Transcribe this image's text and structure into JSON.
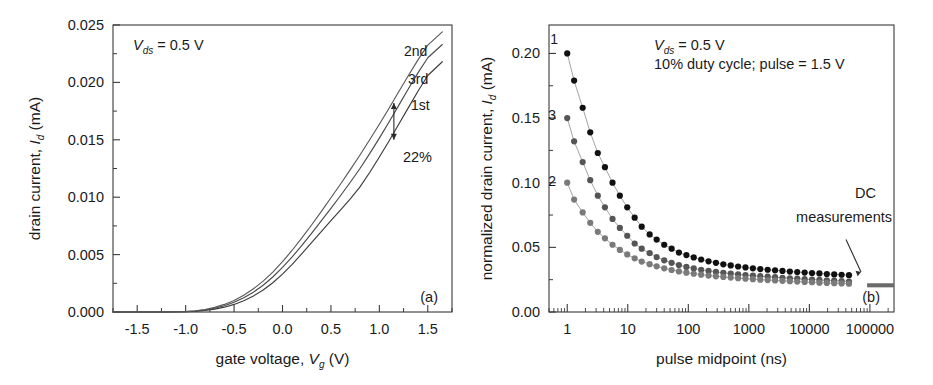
{
  "figure": {
    "background": "#ffffff",
    "panels": [
      "a",
      "b"
    ]
  },
  "panel_a": {
    "tag": "(a)",
    "annotation_vds": "= 0.5 V",
    "annotation_vds_symbol": "V",
    "annotation_vds_sub": "ds",
    "ylabel_prefix": "drain current, ",
    "ylabel_symbol": "I",
    "ylabel_sub": "d",
    "ylabel_suffix": " (mA)",
    "xlabel_prefix": "gate voltage, ",
    "xlabel_symbol": "V",
    "xlabel_sub": "g",
    "xlabel_suffix": " (V)",
    "xticks": [
      "-1.5",
      "-1.0",
      "-0.5",
      "0.0",
      "0.5",
      "1.0",
      "1.5"
    ],
    "yticks": [
      "0.000",
      "0.005",
      "0.010",
      "0.015",
      "0.020",
      "0.025"
    ],
    "curve_labels": [
      "2nd",
      "3rd",
      "1st"
    ],
    "delta_label": "22%"
  },
  "panel_b": {
    "tag": "(b)",
    "annotation_vds_symbol": "V",
    "annotation_vds_sub": "ds",
    "annotation_vds": "= 0.5 V",
    "annotation_duty": "10% duty cycle; pulse = 1.5 V",
    "ylabel_prefix": "normalized drain current, ",
    "ylabel_symbol": "I",
    "ylabel_sub": "d",
    "ylabel_suffix": " (mA)",
    "xlabel": "pulse midpoint (ns)",
    "xticks": [
      "1",
      "10",
      "100",
      "1000",
      "10000",
      "100000"
    ],
    "yticks": [
      "0.00",
      "0.05",
      "0.10",
      "0.15",
      "0.20"
    ],
    "curve_labels": [
      "1",
      "3",
      "2"
    ],
    "dc_label_line1": "DC",
    "dc_label_line2": "measurements"
  },
  "chart_data": [
    {
      "type": "line",
      "panel": "a",
      "title": "",
      "xlabel": "gate voltage, Vg (V)",
      "ylabel": "drain current, Id (mA)",
      "xlim": [
        -1.75,
        1.75
      ],
      "ylim": [
        0.0,
        0.025
      ],
      "xticks": [
        -1.5,
        -1.0,
        -0.5,
        0.0,
        0.5,
        1.0,
        1.5
      ],
      "yticks": [
        0.0,
        0.005,
        0.01,
        0.015,
        0.02,
        0.025
      ],
      "grid": false,
      "legend": "inline-curve-labels",
      "annotations": [
        {
          "text": "Vds = 0.5 V",
          "x": -1.4,
          "y": 0.0235
        },
        {
          "text": "22%",
          "x": 1.15,
          "y": 0.0125
        },
        {
          "text": "(a)",
          "x": 1.5,
          "y": 0.0015
        }
      ],
      "series": [
        {
          "name": "1st",
          "color": "#3c3c3c",
          "x": [
            -1.75,
            -1.5,
            -1.25,
            -1.0,
            -0.9,
            -0.8,
            -0.7,
            -0.6,
            -0.5,
            -0.4,
            -0.3,
            -0.2,
            -0.1,
            0.0,
            0.1,
            0.2,
            0.3,
            0.4,
            0.5,
            0.6,
            0.7,
            0.8,
            0.9,
            1.0,
            1.1,
            1.2,
            1.3,
            1.4,
            1.5,
            1.65
          ],
          "values": [
            0.0,
            0.0,
            0.0,
            2e-05,
            6e-05,
            0.00013,
            0.00025,
            0.00042,
            0.00066,
            0.00098,
            0.0014,
            0.00192,
            0.00255,
            0.0033,
            0.00415,
            0.00508,
            0.00605,
            0.007,
            0.00795,
            0.0089,
            0.00985,
            0.0109,
            0.01215,
            0.0135,
            0.0149,
            0.01635,
            0.0178,
            0.01925,
            0.0206,
            0.0218
          ]
        },
        {
          "name": "3rd",
          "color": "#4a4a4a",
          "x": [
            -1.75,
            -1.5,
            -1.25,
            -1.0,
            -0.9,
            -0.8,
            -0.7,
            -0.6,
            -0.5,
            -0.4,
            -0.3,
            -0.2,
            -0.1,
            0.0,
            0.1,
            0.2,
            0.3,
            0.4,
            0.5,
            0.6,
            0.7,
            0.8,
            0.9,
            1.0,
            1.1,
            1.2,
            1.3,
            1.4,
            1.5,
            1.65
          ],
          "values": [
            0.0,
            0.0,
            0.0,
            3e-05,
            9e-05,
            0.00018,
            0.00033,
            0.00055,
            0.00085,
            0.00124,
            0.00173,
            0.00233,
            0.00305,
            0.00388,
            0.0048,
            0.0058,
            0.00685,
            0.00793,
            0.00903,
            0.01015,
            0.0113,
            0.0125,
            0.0138,
            0.01515,
            0.01655,
            0.018,
            0.01945,
            0.02085,
            0.02215,
            0.0233
          ]
        },
        {
          "name": "2nd",
          "color": "#595959",
          "x": [
            -1.75,
            -1.5,
            -1.25,
            -1.0,
            -0.9,
            -0.8,
            -0.7,
            -0.6,
            -0.5,
            -0.4,
            -0.3,
            -0.2,
            -0.1,
            0.0,
            0.1,
            0.2,
            0.3,
            0.4,
            0.5,
            0.6,
            0.7,
            0.8,
            0.9,
            1.0,
            1.1,
            1.2,
            1.3,
            1.4,
            1.5,
            1.65
          ],
          "values": [
            0.0,
            0.0,
            0.0,
            4e-05,
            0.00011,
            0.00022,
            0.0004,
            0.00066,
            0.00101,
            0.00146,
            0.00202,
            0.00269,
            0.00348,
            0.00438,
            0.00538,
            0.00645,
            0.00758,
            0.00875,
            0.00995,
            0.01115,
            0.0124,
            0.01368,
            0.015,
            0.01635,
            0.01775,
            0.01918,
            0.0206,
            0.02198,
            0.02325,
            0.0244
          ]
        }
      ],
      "delta_marker": {
        "label": "22%",
        "x": 1.15,
        "y_low": 0.015,
        "y_high": 0.0182
      }
    },
    {
      "type": "scatter",
      "panel": "b",
      "title": "",
      "xlabel": "pulse midpoint (ns)",
      "ylabel": "normalized drain current, Id (mA)",
      "xscale": "log",
      "xlim": [
        0.5,
        250000
      ],
      "ylim": [
        0.0,
        0.222
      ],
      "xticks": [
        1,
        10,
        100,
        1000,
        10000,
        100000
      ],
      "yticks": [
        0.0,
        0.05,
        0.1,
        0.15,
        0.2
      ],
      "grid": false,
      "annotations": [
        {
          "text": "Vds = 0.5 V",
          "x": 30,
          "y": 0.208
        },
        {
          "text": "10% duty cycle; pulse = 1.5 V",
          "x": 30,
          "y": 0.193
        },
        {
          "text": "DC measurements",
          "x": 40000,
          "y": 0.082
        },
        {
          "text": "(b)",
          "x": 90000,
          "y": 0.012
        }
      ],
      "series": [
        {
          "name": "1",
          "color": "#111111",
          "x": [
            1,
            1.3,
            1.8,
            2.4,
            3.2,
            4.2,
            5.6,
            7.4,
            9.8,
            13,
            17,
            23,
            30,
            40,
            53,
            70,
            93,
            123,
            163,
            216,
            286,
            379,
            502,
            665,
            881,
            1167,
            1546,
            2048,
            2713,
            3594,
            4761,
            6307,
            8354,
            11065,
            14657,
            19416,
            25719,
            34067,
            45127
          ],
          "values": [
            0.2,
            0.179,
            0.158,
            0.139,
            0.123,
            0.112,
            0.1,
            0.09,
            0.081,
            0.073,
            0.066,
            0.06,
            0.056,
            0.052,
            0.049,
            0.046,
            0.044,
            0.0422,
            0.0406,
            0.0392,
            0.038,
            0.0369,
            0.036,
            0.0352,
            0.0345,
            0.0338,
            0.0332,
            0.0327,
            0.0322,
            0.0318,
            0.0313,
            0.0309,
            0.0305,
            0.0301,
            0.0298,
            0.0294,
            0.0291,
            0.0288,
            0.0285
          ]
        },
        {
          "name": "3",
          "color": "#555555",
          "x": [
            1,
            1.3,
            1.8,
            2.4,
            3.2,
            4.2,
            5.6,
            7.4,
            9.8,
            13,
            17,
            23,
            30,
            40,
            53,
            70,
            93,
            123,
            163,
            216,
            286,
            379,
            502,
            665,
            881,
            1167,
            1546,
            2048,
            2713,
            3594,
            4761,
            6307,
            8354,
            11065,
            14657,
            19416,
            25719,
            34067,
            45127
          ],
          "values": [
            0.15,
            0.132,
            0.116,
            0.102,
            0.09,
            0.081,
            0.072,
            0.065,
            0.059,
            0.053,
            0.049,
            0.0455,
            0.0425,
            0.04,
            0.038,
            0.0363,
            0.0349,
            0.0337,
            0.0327,
            0.0318,
            0.031,
            0.0303,
            0.0297,
            0.0291,
            0.0286,
            0.0281,
            0.0277,
            0.0273,
            0.0269,
            0.0265,
            0.0261,
            0.0258,
            0.0254,
            0.0251,
            0.0248,
            0.0245,
            0.0242,
            0.0239,
            0.0236
          ]
        },
        {
          "name": "2",
          "color": "#7a7a7a",
          "x": [
            1,
            1.3,
            1.8,
            2.4,
            3.2,
            4.2,
            5.6,
            7.4,
            9.8,
            13,
            17,
            23,
            30,
            40,
            53,
            70,
            93,
            123,
            163,
            216,
            286,
            379,
            502,
            665,
            881,
            1167,
            1546,
            2048,
            2713,
            3594,
            4761,
            6307,
            8354,
            11065,
            14657,
            19416,
            25719,
            34067,
            45127
          ],
          "values": [
            0.1,
            0.087,
            0.077,
            0.069,
            0.062,
            0.057,
            0.052,
            0.048,
            0.0445,
            0.0415,
            0.039,
            0.037,
            0.0353,
            0.0338,
            0.0325,
            0.0314,
            0.0304,
            0.0296,
            0.0289,
            0.0282,
            0.0276,
            0.0271,
            0.0266,
            0.0262,
            0.0258,
            0.0254,
            0.025,
            0.0247,
            0.0244,
            0.0241,
            0.0238,
            0.0235,
            0.0232,
            0.023,
            0.0227,
            0.0225,
            0.0223,
            0.0221,
            0.0219
          ]
        }
      ],
      "dc_lines": {
        "x_start": 90000,
        "x_end": 220000,
        "values": [
          0.0215,
          0.0205,
          0.0198
        ]
      }
    }
  ]
}
